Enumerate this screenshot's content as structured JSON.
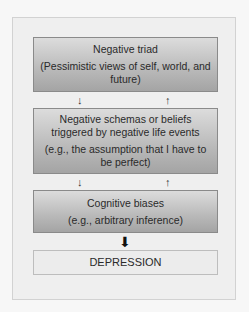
{
  "boxes": {
    "triad": {
      "title": "Negative triad",
      "detail": "(Pessimistic views of self, world, and future)"
    },
    "schemas": {
      "title": "Negative schemas or beliefs triggered by negative life events",
      "detail": "(e.g., the assumption that I have to be perfect)"
    },
    "biases": {
      "title": "Cognitive biases",
      "detail": "(e.g., arbitrary inference)"
    },
    "outcome": {
      "title": "DEPRESSION"
    }
  },
  "arrows": {
    "down": "↓",
    "up": "↑",
    "big_down": "⬇"
  }
}
